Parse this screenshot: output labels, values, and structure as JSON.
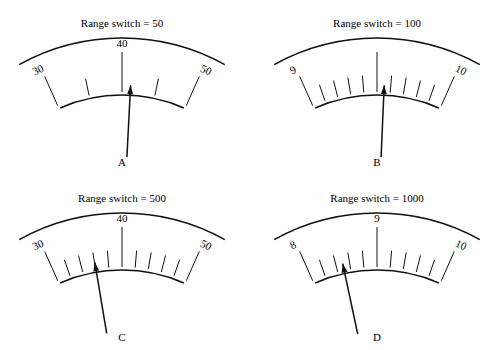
{
  "figure": {
    "colors": {
      "ink": "#111111",
      "background": "#ffffff"
    },
    "gauges": [
      {
        "id": "A",
        "letter": "A",
        "title": "Range switch = 50",
        "offset": [
          0,
          0
        ],
        "scale_labels": [
          "30",
          "40",
          "50"
        ],
        "minor_per_major": 2,
        "pointer_angle_deg": 3
      },
      {
        "id": "B",
        "letter": "B",
        "title": "Range switch = 100",
        "offset": [
          255,
          0
        ],
        "scale_labels": [
          "9",
          "",
          "10"
        ],
        "minor_per_major": 5,
        "pointer_angle_deg": 2.5
      },
      {
        "id": "C",
        "letter": "C",
        "title": "Range switch = 500",
        "offset": [
          0,
          175
        ],
        "scale_labels": [
          "30",
          "40",
          "50"
        ],
        "minor_per_major": 5,
        "pointer_angle_deg": -9.5
      },
      {
        "id": "D",
        "letter": "D",
        "title": "Range switch = 1000",
        "offset": [
          255,
          175
        ],
        "scale_labels": [
          "8",
          "9",
          "10"
        ],
        "minor_per_major": 5,
        "pointer_angle_deg": -12
      }
    ]
  }
}
